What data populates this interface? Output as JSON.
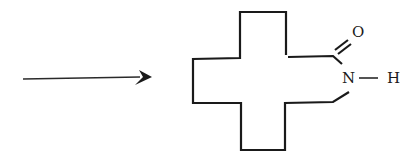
{
  "diagram": {
    "type": "chemical-reaction-scheme",
    "arrow": {
      "direction": "right"
    },
    "molecule": {
      "ring": "macrocyclic lactam (cross-shaped ring skeleton)",
      "atoms": {
        "oxygen": "O",
        "nitrogen": "N",
        "hydrogen": "H"
      },
      "bonds": [
        {
          "from": "C",
          "to": "O",
          "order": 2
        },
        {
          "from": "C",
          "to": "N",
          "order": 1
        },
        {
          "from": "N",
          "to": "H",
          "order": 1
        },
        {
          "from": "N",
          "to": "C",
          "order": 1
        }
      ]
    },
    "colors": {
      "ink": "#1a1a1a",
      "background": "#ffffff"
    }
  }
}
